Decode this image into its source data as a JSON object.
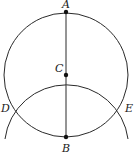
{
  "diagram": {
    "type": "geometric-construction",
    "points": {
      "A": {
        "label": "A",
        "x": 66,
        "y": 12
      },
      "C": {
        "label": "C",
        "x": 66,
        "y": 75
      },
      "B": {
        "label": "B",
        "x": 66,
        "y": 137
      },
      "D": {
        "label": "D",
        "x": 12,
        "y": 108
      },
      "E": {
        "label": "E",
        "x": 120,
        "y": 108
      }
    },
    "segments": [
      {
        "from": "A",
        "to": "B"
      }
    ],
    "circles": [
      {
        "name": "circle-centered-C",
        "center": "C",
        "radius": 62,
        "through": [
          "A",
          "B",
          "D",
          "E"
        ]
      }
    ],
    "arcs": [
      {
        "name": "arc-centered-B",
        "center": "B",
        "radius": 62,
        "through": [
          "C",
          "D",
          "E"
        ]
      }
    ],
    "colors": {
      "line": "#2a2a2a",
      "point": "#111111",
      "background": "#ffffff"
    }
  }
}
